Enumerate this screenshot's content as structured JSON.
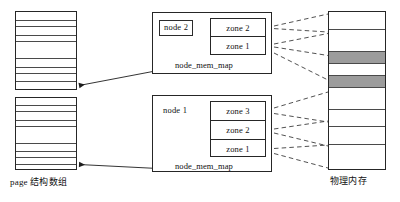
{
  "diagram": {
    "captions": {
      "page_array": "page 结构数组",
      "physical_memory": "物理内存"
    },
    "nodes": [
      {
        "id": "node-2",
        "label": "node 2",
        "label_boxed": true,
        "mem_map_label": "node_mem_map",
        "zones": [
          {
            "label": "zone 2"
          },
          {
            "label": "zone 1"
          }
        ]
      },
      {
        "id": "node-1",
        "label": "node 1",
        "label_boxed": false,
        "mem_map_label": "node_mem_map",
        "zones": [
          {
            "label": "zone 3"
          },
          {
            "label": "zone 2"
          },
          {
            "label": "zone 1"
          }
        ]
      }
    ],
    "page_arrays": [
      {
        "id": "page-array-top",
        "cell_heights": [
          9,
          6,
          9,
          6,
          17,
          9,
          6,
          8,
          8
        ]
      },
      {
        "id": "page-array-bottom",
        "cell_heights": [
          8,
          6,
          9,
          6,
          17,
          8,
          6,
          8,
          7
        ]
      }
    ],
    "physical_memory": {
      "id": "physical-memory-column",
      "cells": [
        {
          "shaded": false,
          "height": 18
        },
        {
          "shaded": false,
          "height": 22
        },
        {
          "shaded": true,
          "height": 12
        },
        {
          "shaded": false,
          "height": 12
        },
        {
          "shaded": true,
          "height": 12
        },
        {
          "shaded": false,
          "height": 22
        },
        {
          "shaded": false,
          "height": 17
        },
        {
          "shaded": false,
          "height": 18
        },
        {
          "shaded": false,
          "height": 25
        }
      ]
    },
    "colors": {
      "stroke": "#262626",
      "divider": "#4a4a4a",
      "shade": "#9c9c9c",
      "background": "#ffffff",
      "text": "#111111"
    }
  }
}
